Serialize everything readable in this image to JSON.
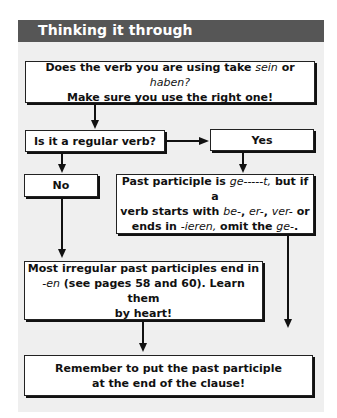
{
  "header": {
    "title": "Thinking it through"
  },
  "colors": {
    "header_bg": "#565656",
    "panel_bg": "#efefef",
    "box_bg": "#ffffff",
    "line": "#111111"
  },
  "boxes": {
    "sein_haben": {
      "line1_a": "Does the verb you are using take ",
      "line1_em1": "sein",
      "line1_b": " or ",
      "line1_em2": "haben?",
      "line2": "Make sure you use the right one!"
    },
    "regular_verb": {
      "label": "Is it a regular verb?"
    },
    "yes": {
      "label": "Yes"
    },
    "no": {
      "label": "No"
    },
    "past_participle": {
      "l1_a": "Past participle is ",
      "l1_em": "ge-----t,",
      "l1_b": " but if a",
      "l2_a": "verb starts with ",
      "l2_em1": "be-",
      "l2_sep1": ", ",
      "l2_em2": "er-",
      "l2_sep2": ", ",
      "l2_em3": "ver-",
      "l2_b": " or",
      "l3_a": "ends in ",
      "l3_em1": "-ieren,",
      "l3_b": " omit the ",
      "l3_em2": "ge-",
      "l3_c": "."
    },
    "irregular": {
      "l1": "Most irregular past participles end in",
      "l2_em": "-en",
      "l2_b": " (see pages 58 and 60). Learn them",
      "l3": "by heart!"
    },
    "remember": {
      "l1": "Remember to put the past participle",
      "l2": "at the end of the clause!"
    }
  }
}
